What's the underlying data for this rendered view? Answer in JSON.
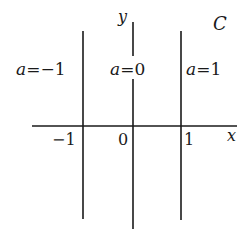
{
  "diagram": {
    "region_label": "C",
    "axes": {
      "x_label": "x",
      "y_label": "y"
    },
    "ticks": [
      {
        "label": "−1",
        "value": -1
      },
      {
        "label": "0",
        "value": 0
      },
      {
        "label": "1",
        "value": 1
      }
    ],
    "lines": [
      {
        "param_name": "a",
        "equals": "=",
        "value_label": "−1",
        "x": -1
      },
      {
        "param_name": "a",
        "equals": "=",
        "value_label": "0",
        "x": 0
      },
      {
        "param_name": "a",
        "equals": "=",
        "value_label": "1",
        "x": 1
      }
    ],
    "colors": {
      "ink": "#1a1a1a",
      "background": "#ffffff"
    }
  }
}
